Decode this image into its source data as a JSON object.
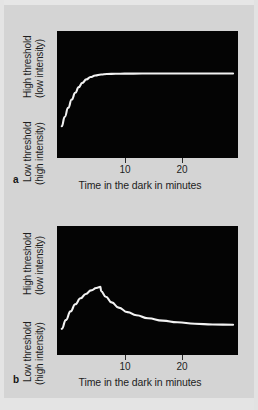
{
  "figure": {
    "background_color": "#d4d4d4",
    "plot_background_color": "#040404",
    "curve_color": "#f2f2f2"
  },
  "axis": {
    "y_high_line1": "High threshold",
    "y_high_line2": "(low intensity)",
    "y_low_line1": "Low threshold",
    "y_low_line2": "(high intensity)",
    "x_title": "Time in the dark in minutes",
    "ticks": [
      {
        "label": "10",
        "x": 125
      },
      {
        "label": "20",
        "x": 182
      }
    ]
  },
  "panels": [
    {
      "letter": "a"
    },
    {
      "letter": "b"
    }
  ],
  "chart_data": [
    {
      "type": "line",
      "title": "",
      "panel": "a",
      "xlabel": "Time in the dark in minutes",
      "ylabel": "Threshold (High threshold = low intensity; Low threshold = high intensity)",
      "xlim": [
        0,
        30
      ],
      "ylim": [
        0,
        1
      ],
      "xticks": [
        10,
        20
      ],
      "yticks": [],
      "grid": false,
      "legend": "none",
      "annotation": "Monophasic dark adaptation curve: threshold falls rapidly then plateaus (cone-only adaptation).",
      "series": [
        {
          "name": "dark adaptation curve (monophasic)",
          "x": [
            0.3,
            0.8,
            1.4,
            2.0,
            2.6,
            3.2,
            3.8,
            4.5,
            5.2,
            6.0,
            7.0,
            8.0,
            9.5,
            11.0,
            14.0,
            18.0,
            22.0,
            26.0,
            29.5
          ],
          "y_norm": [
            0.755,
            0.66,
            0.565,
            0.48,
            0.41,
            0.352,
            0.308,
            0.272,
            0.248,
            0.232,
            0.222,
            0.217,
            0.214,
            0.213,
            0.212,
            0.212,
            0.212,
            0.212,
            0.212
          ]
        }
      ]
    },
    {
      "type": "line",
      "title": "",
      "panel": "b",
      "xlabel": "Time in the dark in minutes",
      "ylabel": "Threshold (High threshold = low intensity; Low threshold = high intensity)",
      "xlim": [
        0,
        30
      ],
      "ylim": [
        0,
        1
      ],
      "xticks": [
        10,
        20
      ],
      "yticks": [],
      "grid": false,
      "legend": "none",
      "annotation": "Biphasic dark adaptation curve with a rod-cone break (kink) at about 7 minutes, after which the threshold continues to fall.",
      "series": [
        {
          "name": "dark adaptation curve (biphasic, with rod-cone break)",
          "x": [
            0.3,
            1.0,
            1.8,
            2.6,
            3.5,
            4.4,
            5.3,
            6.2,
            6.9,
            7.0,
            7.8,
            8.8,
            10.0,
            11.5,
            13.0,
            15.0,
            17.5,
            20.0,
            23.0,
            26.0,
            29.5
          ],
          "y_norm": [
            0.815,
            0.735,
            0.655,
            0.59,
            0.535,
            0.495,
            0.462,
            0.44,
            0.43,
            0.47,
            0.52,
            0.572,
            0.62,
            0.662,
            0.69,
            0.718,
            0.74,
            0.755,
            0.768,
            0.775,
            0.778
          ]
        }
      ]
    }
  ]
}
